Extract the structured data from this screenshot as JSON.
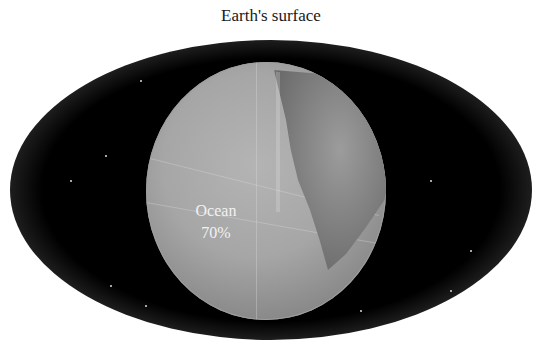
{
  "title": "Earth's surface",
  "globe": {
    "label": "Ocean",
    "value": "70%"
  },
  "colors": {
    "background": "#ffffff",
    "space": "#000000",
    "ocean": "#a6a6a6",
    "land": "#7d7d7d",
    "label_text": "#f2f2f2"
  }
}
